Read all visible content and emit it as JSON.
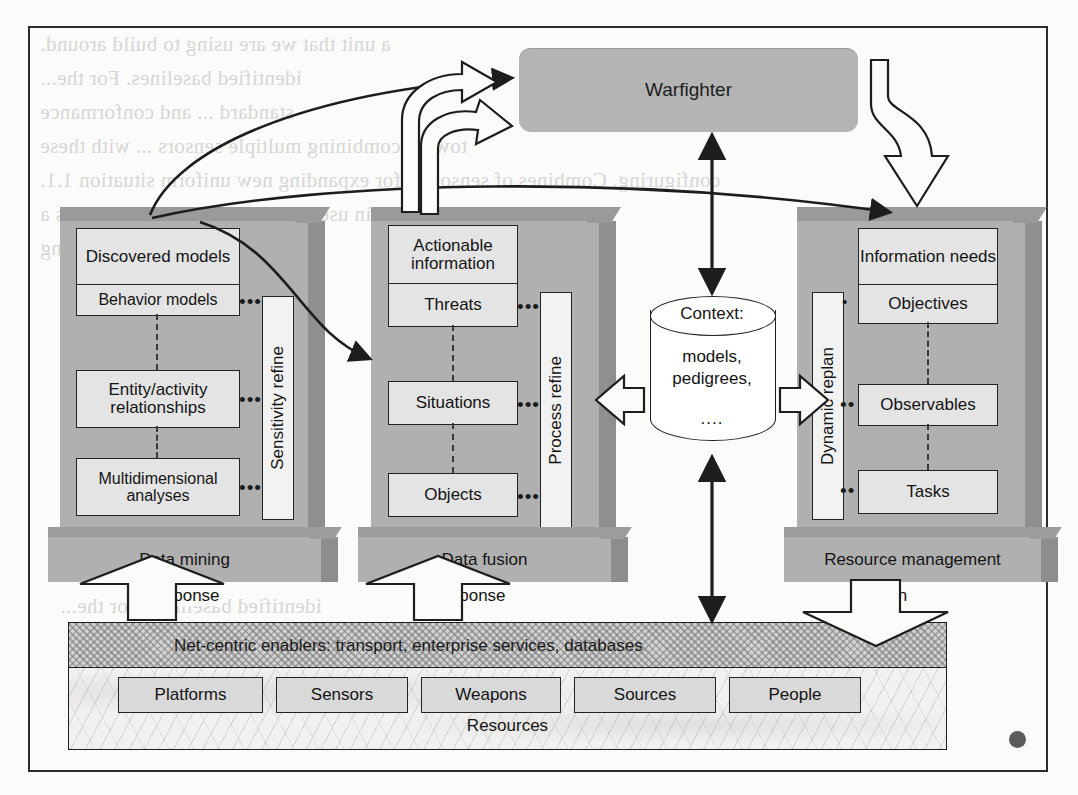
{
  "diagram": {
    "warfighter": {
      "label": "Warfighter"
    },
    "pillars": [
      {
        "name": "data-mining",
        "pedestal_label": "Data mining",
        "side_label": "Sensitivity refine",
        "cells": [
          "Discovered models",
          "Behavior models",
          "Entity/activity relationships",
          "Multidimensional analyses"
        ],
        "bottom_arrow_label": "Response"
      },
      {
        "name": "data-fusion",
        "pedestal_label": "Data fusion",
        "side_label": "Process refine",
        "cells": [
          "Actionable information",
          "Threats",
          "Situations",
          "Objects"
        ],
        "bottom_arrow_label": "Response"
      },
      {
        "name": "resource-management",
        "pedestal_label": "Resource management",
        "side_label": "Dynamic replan",
        "cells": [
          "Information needs",
          "Objectives",
          "Observables",
          "Tasks"
        ],
        "bottom_arrow_label": "Action"
      }
    ],
    "context": {
      "title": "Context:",
      "body": "models,\npedigrees,",
      "ellipsis": "...."
    },
    "net_centric_bar": {
      "label": "Net-centric enablers: transport, enterprise services, databases"
    },
    "resources": {
      "label": "Resources",
      "items": [
        "Platforms",
        "Sensors",
        "Weapons",
        "Sources",
        "People"
      ]
    },
    "ghost_text": [
      "a unit that we are using to build around.",
      "identified baselines.  For the...",
      "standard ... and conformance",
      "toward combining multiple sensors ... with these",
      "configuring. Combines of sensors S for expanding new uniform situation 1.1.",
      "a a sensing in use to using in the ... a represents a",
      "...  are derived to the ... wording"
    ]
  },
  "colors": {
    "pillar_face": "#b0b0b0",
    "pillar_top": "#9d9d9d",
    "cell_fill": "#e4e4e4",
    "ink": "#1e1e1e",
    "bar_fill": "#d2d2d2"
  }
}
